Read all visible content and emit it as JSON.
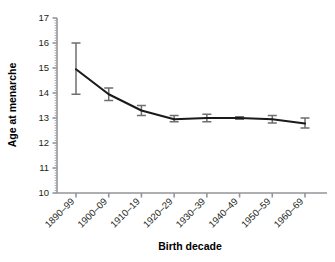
{
  "chart_data": {
    "type": "line",
    "title": "",
    "xlabel": "Birth decade",
    "ylabel": "Age at menarche",
    "categories": [
      "1890–99",
      "1900–09",
      "1910–19",
      "1920–29",
      "1930–39",
      "1940–49",
      "1950–59",
      "1960–69"
    ],
    "values": [
      14.95,
      13.95,
      13.3,
      12.95,
      13.0,
      13.0,
      12.95,
      12.78
    ],
    "error_low": [
      13.95,
      13.7,
      13.1,
      12.85,
      12.85,
      12.95,
      12.8,
      12.6
    ],
    "error_high": [
      16.0,
      14.2,
      13.5,
      13.1,
      13.15,
      13.05,
      13.1,
      13.0
    ],
    "ylim": [
      10,
      17
    ],
    "yticks": [
      10,
      11,
      12,
      13,
      14,
      15,
      16,
      17
    ],
    "ytick_labels": [
      "10",
      "11",
      "12",
      "13",
      "14",
      "15",
      "16",
      "17"
    ],
    "minor_ticks_per_interval": 10,
    "grid": false,
    "legend": "none",
    "marker": "none",
    "line_color": "#1a1a1a",
    "error_bar_color": "#6d6e71",
    "axis_color": "#939598",
    "background": "#ffffff"
  },
  "axes": {
    "y_title": "Age at menarche",
    "x_title": "Birth decade"
  }
}
